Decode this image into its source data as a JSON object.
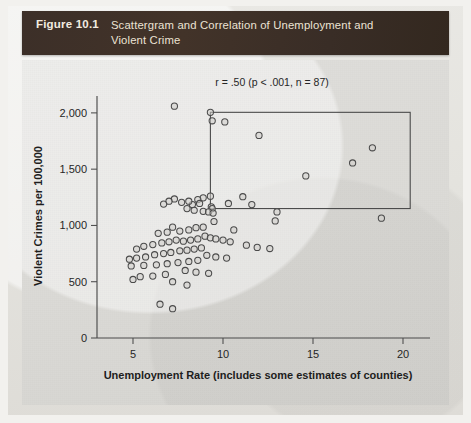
{
  "figure": {
    "number_label": "Figure 10.1",
    "title": "Scattergram and Correlation of Unemployment and Violent Crime"
  },
  "colors": {
    "header_background": "#3c2f28",
    "header_text": "#ece3d4",
    "plot_background": "#dcdbd7",
    "axis": "#4b4b4b",
    "point_stroke": "#4a4a4a",
    "box_stroke": "#4a4a4a"
  },
  "annotation": {
    "stats_text": "r = .50 (p < .001, n = 87)"
  },
  "highlight_box": {
    "x_min": 9.3,
    "x_max": 20.4,
    "y_min": 1150,
    "y_max": 2005
  },
  "chart_data": {
    "type": "scatter",
    "title": "Scattergram and Correlation of Unemployment and Violent Crime",
    "xlabel": "Unemployment Rate (includes some estimates of counties)",
    "ylabel": "Violent Crimes per 100,000",
    "xlim": [
      3.0,
      21.5
    ],
    "ylim": [
      0,
      2150
    ],
    "xticks": [
      5,
      10,
      15,
      20
    ],
    "xticklabels": [
      "5",
      "10",
      "15",
      "20"
    ],
    "yticks": [
      0,
      500,
      1000,
      1500,
      2000
    ],
    "yticklabels": [
      "0",
      "500",
      "1,000",
      "1,500",
      "2,000"
    ],
    "grid": false,
    "legend": null,
    "correlation_r": 0.5,
    "p_value": "<.001",
    "n": 87,
    "marker": "open-circle",
    "points": [
      [
        7.3,
        2060
      ],
      [
        9.3,
        2005
      ],
      [
        9.4,
        1930
      ],
      [
        10.1,
        1920
      ],
      [
        12.0,
        1800
      ],
      [
        18.3,
        1690
      ],
      [
        17.2,
        1555
      ],
      [
        14.6,
        1440
      ],
      [
        9.3,
        1260
      ],
      [
        11.1,
        1255
      ],
      [
        10.3,
        1195
      ],
      [
        11.6,
        1185
      ],
      [
        9.35,
        1165
      ],
      [
        9.4,
        1150
      ],
      [
        8.9,
        1245
      ],
      [
        8.6,
        1230
      ],
      [
        8.7,
        1195
      ],
      [
        8.3,
        1185
      ],
      [
        8.1,
        1215
      ],
      [
        7.7,
        1205
      ],
      [
        7.3,
        1235
      ],
      [
        7.0,
        1215
      ],
      [
        6.7,
        1190
      ],
      [
        8.0,
        1150
      ],
      [
        8.4,
        1135
      ],
      [
        8.9,
        1125
      ],
      [
        9.2,
        1120
      ],
      [
        9.45,
        1110
      ],
      [
        13.0,
        1120
      ],
      [
        18.8,
        1065
      ],
      [
        12.9,
        1040
      ],
      [
        9.5,
        1035
      ],
      [
        10.6,
        960
      ],
      [
        8.9,
        985
      ],
      [
        8.5,
        980
      ],
      [
        8.1,
        960
      ],
      [
        7.6,
        950
      ],
      [
        7.2,
        985
      ],
      [
        6.9,
        940
      ],
      [
        6.4,
        930
      ],
      [
        9.0,
        905
      ],
      [
        9.3,
        890
      ],
      [
        9.6,
        880
      ],
      [
        10.0,
        870
      ],
      [
        10.4,
        855
      ],
      [
        8.6,
        880
      ],
      [
        8.2,
        870
      ],
      [
        7.8,
        860
      ],
      [
        7.4,
        870
      ],
      [
        7.0,
        855
      ],
      [
        6.6,
        845
      ],
      [
        6.1,
        830
      ],
      [
        5.6,
        815
      ],
      [
        5.2,
        790
      ],
      [
        11.3,
        825
      ],
      [
        11.9,
        805
      ],
      [
        12.6,
        795
      ],
      [
        8.8,
        800
      ],
      [
        8.4,
        790
      ],
      [
        8.0,
        780
      ],
      [
        7.6,
        775
      ],
      [
        7.1,
        760
      ],
      [
        6.7,
        750
      ],
      [
        6.2,
        740
      ],
      [
        5.7,
        720
      ],
      [
        5.2,
        710
      ],
      [
        4.8,
        700
      ],
      [
        9.1,
        735
      ],
      [
        9.6,
        720
      ],
      [
        10.2,
        710
      ],
      [
        8.6,
        690
      ],
      [
        8.1,
        680
      ],
      [
        7.5,
        670
      ],
      [
        6.9,
        660
      ],
      [
        6.3,
        650
      ],
      [
        5.6,
        645
      ],
      [
        4.9,
        640
      ],
      [
        7.9,
        600
      ],
      [
        8.5,
        585
      ],
      [
        9.2,
        575
      ],
      [
        6.8,
        565
      ],
      [
        6.1,
        550
      ],
      [
        5.4,
        545
      ],
      [
        5.0,
        520
      ],
      [
        7.2,
        500
      ],
      [
        8.0,
        470
      ],
      [
        6.5,
        300
      ],
      [
        7.2,
        260
      ]
    ]
  }
}
